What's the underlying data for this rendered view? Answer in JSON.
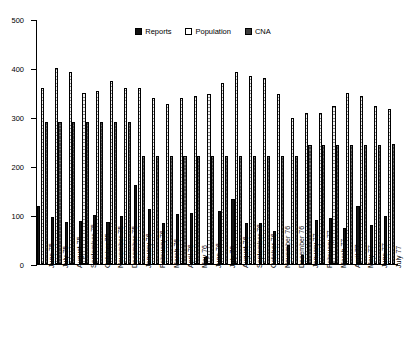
{
  "chart_data": {
    "type": "bar",
    "title": "",
    "subtitle": "",
    "xlabel": "",
    "ylabel": "",
    "ylim": [
      0,
      500
    ],
    "yticks": [
      0,
      100,
      200,
      300,
      400,
      500
    ],
    "grid": false,
    "legend_position": "top-center",
    "categories": [
      "June 75",
      "July 75",
      "August 75",
      "September 75",
      "October 75",
      "November 75",
      "December 75",
      "January 76",
      "February 76",
      "March 76",
      "April 76",
      "May 76",
      "June 76",
      "July 76",
      "August 76",
      "September 76",
      "October 76",
      "November 76",
      "December 76",
      "January 77",
      "February 77",
      "March 77",
      "April 77",
      "May 77",
      "June 77",
      "July 77"
    ],
    "series": [
      {
        "name": "Reports",
        "color": "#151515",
        "values": [
          118,
          95,
          86,
          88,
          100,
          86,
          99,
          161,
          113,
          84,
          103,
          104,
          14,
          108,
          132,
          84,
          84,
          67,
          38,
          18,
          89,
          94,
          73,
          118,
          79,
          98
        ]
      },
      {
        "name": "Population",
        "color": "#f2f2f2",
        "values": [
          360,
          400,
          391,
          348,
          354,
          374,
          359,
          359,
          338,
          327,
          338,
          342,
          347,
          369,
          391,
          384,
          379,
          347,
          297,
          308,
          308,
          322,
          348,
          342,
          322,
          317
        ]
      },
      {
        "name": "CNA",
        "color": "#444444",
        "values": [
          290,
          290,
          290,
          290,
          290,
          290,
          290,
          220,
          221,
          221,
          221,
          220,
          220,
          220,
          220,
          221,
          221,
          220,
          220,
          243,
          243,
          243,
          243,
          243,
          243,
          244
        ]
      }
    ]
  },
  "legend": {
    "entries": [
      {
        "label": "Reports",
        "icon": "square-swatch-dark"
      },
      {
        "label": "Population",
        "icon": "square-swatch-light"
      },
      {
        "label": "CNA",
        "icon": "square-swatch-gray"
      }
    ]
  },
  "axes": {
    "y_tick_labels": [
      "500",
      "400",
      "300",
      "200",
      "100",
      "0"
    ]
  }
}
